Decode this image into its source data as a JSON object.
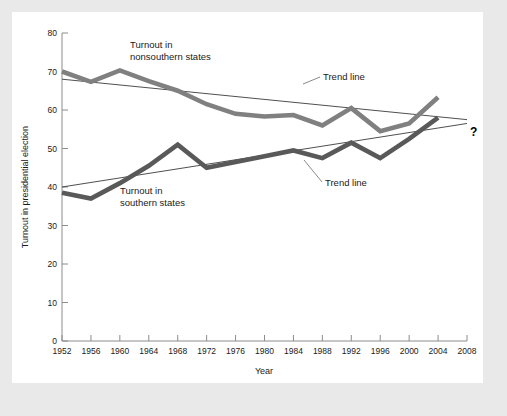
{
  "figure": {
    "background_color": "#ffffff",
    "page_background_color": "#e9e9e9"
  },
  "axes": {
    "y_title": "Turnout in presidential election",
    "x_title": "Year",
    "y_ticks": [
      "0",
      "10",
      "20",
      "30",
      "40",
      "50",
      "60",
      "70",
      "80"
    ],
    "x_ticks": [
      "1952",
      "1956",
      "1960",
      "1964",
      "1968",
      "1972",
      "1976",
      "1980",
      "1984",
      "1988",
      "1992",
      "1996",
      "2000",
      "2004",
      "2008"
    ]
  },
  "annotations": {
    "nonsouthern_label_line1": "Turnout in",
    "nonsouthern_label_line2": "nonsouthern states",
    "southern_label_line1": "Turnout in",
    "southern_label_line2": "southern states",
    "trend_label_upper": "Trend line",
    "trend_label_lower": "Trend line",
    "future_marker": "?"
  },
  "chart_data": {
    "type": "line",
    "title": "",
    "xlabel": "Year",
    "ylabel": "Turnout in presidential election",
    "xlim": [
      1952,
      2008
    ],
    "ylim": [
      0,
      80
    ],
    "grid": false,
    "legend": "inline-annotations",
    "x": [
      1952,
      1956,
      1960,
      1964,
      1968,
      1972,
      1976,
      1980,
      1984,
      1988,
      1992,
      1996,
      2000,
      2004
    ],
    "series": [
      {
        "name": "Turnout in nonsouthern states",
        "color": "#808080",
        "values": [
          70.0,
          67.3,
          70.3,
          67.5,
          65.0,
          61.5,
          59.0,
          58.3,
          58.7,
          56.0,
          60.5,
          54.5,
          56.5,
          63.3
        ]
      },
      {
        "name": "Turnout in southern states",
        "color": "#595959",
        "values": [
          38.5,
          37.0,
          41.0,
          45.5,
          51.0,
          45.0,
          46.5,
          48.0,
          49.5,
          47.5,
          51.5,
          47.5,
          52.5,
          58.0
        ]
      }
    ],
    "trend_lines": [
      {
        "name": "Trend line (nonsouthern)",
        "color": "#3b3b3b",
        "x": [
          1952,
          2008
        ],
        "values": [
          68.0,
          57.5
        ]
      },
      {
        "name": "Trend line (southern)",
        "color": "#3b3b3b",
        "x": [
          1952,
          2008
        ],
        "values": [
          40.0,
          56.5
        ]
      }
    ]
  }
}
